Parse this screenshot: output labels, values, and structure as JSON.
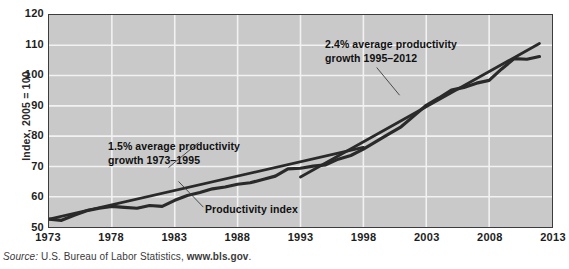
{
  "chart_data": {
    "type": "line",
    "title": "",
    "xlabel": "",
    "ylabel": "Index, 2005 = 100",
    "xlim": [
      1973,
      2013
    ],
    "ylim": [
      50,
      120
    ],
    "grid": true,
    "legend_position": "inline-annotations",
    "x_ticks": [
      "1973",
      "1978",
      "1983",
      "1988",
      "1993",
      "1998",
      "2003",
      "2008",
      "2013"
    ],
    "y_ticks": [
      "50",
      "60",
      "70",
      "80",
      "90",
      "100",
      "110",
      "120"
    ],
    "series": [
      {
        "name": "Productivity index",
        "x": [
          1973,
          1974,
          1975,
          1976,
          1977,
          1978,
          1979,
          1980,
          1981,
          1982,
          1983,
          1984,
          1985,
          1986,
          1987,
          1988,
          1989,
          1990,
          1991,
          1992,
          1993,
          1994,
          1995,
          1996,
          1997,
          1998,
          1999,
          2000,
          2001,
          2002,
          2003,
          2004,
          2005,
          2006,
          2007,
          2008,
          2009,
          2010,
          2011,
          2012
        ],
        "values": [
          52.6,
          52.2,
          53.9,
          55.4,
          56.2,
          56.8,
          56.5,
          56.2,
          57.1,
          56.8,
          58.8,
          60.4,
          61.4,
          62.6,
          63.2,
          64.1,
          64.6,
          65.7,
          66.8,
          69.2,
          69.4,
          70.1,
          70.5,
          72.4,
          73.6,
          75.7,
          78.2,
          80.7,
          83.1,
          86.6,
          90.2,
          92.6,
          95.2,
          96.1,
          97.5,
          98.4,
          102.2,
          105.6,
          105.4,
          106.3
        ],
        "style": "thick-dark-line"
      },
      {
        "name": "1.5% average productivity growth 1973-1995 trend",
        "x": [
          1973,
          1998
        ],
        "values": [
          52.6,
          76.3
        ],
        "style": "straight-trend-line"
      },
      {
        "name": "2.4% average productivity growth 1995-2012 trend",
        "x": [
          1993,
          2012
        ],
        "values": [
          66.5,
          110.6
        ],
        "style": "straight-trend-line"
      }
    ],
    "annotations": [
      {
        "name": "slow-growth-annotation",
        "line1": "1.5% average productivity",
        "line2": "growth 1973–1995",
        "rate": "1.5%",
        "period": "1973–1995"
      },
      {
        "name": "fast-growth-annotation",
        "line1": "2.4% average productivity",
        "line2": "growth 1995–2012",
        "rate": "2.4%",
        "period": "1995–2012"
      },
      {
        "name": "series-label",
        "text": "Productivity index"
      }
    ],
    "colors": {
      "plot_background": "#c9c9c9",
      "gridline": "#f2f2f2",
      "data_line": "#2a2a2a",
      "trend_line": "#2a2a2a",
      "border": "#3c3c3c",
      "text": "#101010"
    }
  },
  "axis": {
    "y_title": "Index, 2005 = 100"
  },
  "source": {
    "prefix": "Source:",
    "agency": "U.S. Bureau of Labor Statistics,",
    "url": "www.bls.gov",
    "suffix": "."
  }
}
